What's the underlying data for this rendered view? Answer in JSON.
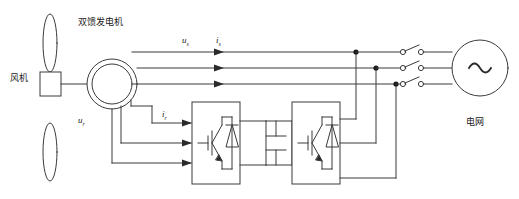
{
  "diagram": {
    "stroke_color": "#3a3a3a",
    "text_color": "#1a1a1a",
    "background": "#ffffff"
  },
  "labels": {
    "wind_turbine": "风机",
    "generator": "双馈发电机",
    "grid": "电网",
    "stator_voltage": "u",
    "stator_voltage_sub": "s",
    "stator_current": "i",
    "stator_current_sub": "s",
    "rotor_voltage": "u",
    "rotor_voltage_sub": "r",
    "rotor_current": "i",
    "rotor_current_sub": "r",
    "ac_source_symbol": "∼"
  },
  "components": {
    "turbine": {
      "name": "wind-turbine",
      "blades": 2,
      "hub": "square"
    },
    "machine": {
      "name": "doubly-fed-induction-generator",
      "shape": "concentric-circles"
    },
    "rotor_side_converter": {
      "name": "rotor-side-converter",
      "device": "IGBT with antiparallel diode"
    },
    "dc_link": {
      "name": "dc-link-capacitor",
      "device": "capacitor"
    },
    "grid_side_converter": {
      "name": "grid-side-converter",
      "device": "IGBT with antiparallel diode"
    },
    "breakers": {
      "name": "circuit-breakers",
      "count": 3
    },
    "grid_source": {
      "name": "grid-ac-source"
    }
  }
}
